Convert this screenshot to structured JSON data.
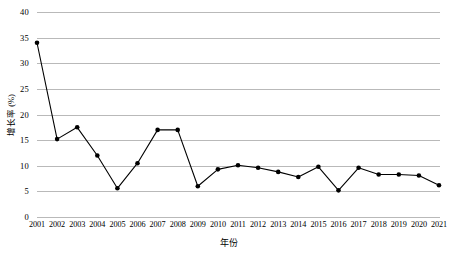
{
  "chart_data": {
    "type": "line",
    "title": "",
    "xlabel": "年份",
    "ylabel": "增长率 (%)",
    "ylim": [
      0,
      40
    ],
    "ytick_step": 5,
    "yticks": [
      0,
      5,
      10,
      15,
      20,
      25,
      30,
      35,
      40
    ],
    "ytick_labels": [
      "0",
      "5",
      "10",
      "15",
      "20",
      "25",
      "30",
      "35",
      "40"
    ],
    "grid": "horizontal",
    "legend": "none",
    "marker": "filled-circle",
    "line_color": "#000000",
    "marker_color": "#000000",
    "grid_color": "#b9b9b9",
    "categories": [
      "2001",
      "2002",
      "2003",
      "2004",
      "2005",
      "2006",
      "2007",
      "2008",
      "2009",
      "2010",
      "2011",
      "2012",
      "2013",
      "2014",
      "2015",
      "2016",
      "2017",
      "2018",
      "2019",
      "2020",
      "2021"
    ],
    "values": [
      34.0,
      15.2,
      17.5,
      12.0,
      5.6,
      10.5,
      17.0,
      17.0,
      6.0,
      9.3,
      10.1,
      9.6,
      8.8,
      7.8,
      9.8,
      5.2,
      9.6,
      8.3,
      8.3,
      8.1,
      6.2
    ],
    "series": [
      {
        "name": "增长率",
        "values": [
          34.0,
          15.2,
          17.5,
          12.0,
          5.6,
          10.5,
          17.0,
          17.0,
          6.0,
          9.3,
          10.1,
          9.6,
          8.8,
          7.8,
          9.8,
          5.2,
          9.6,
          8.3,
          8.3,
          8.1,
          6.2
        ]
      }
    ]
  }
}
